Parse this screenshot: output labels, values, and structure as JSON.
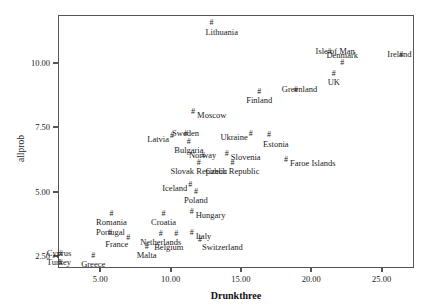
{
  "chart_data": {
    "type": "scatter",
    "title": "",
    "xlabel": "Drunkthree",
    "ylabel": "allprob",
    "xlim": [
      2.0,
      27.3
    ],
    "ylim": [
      2.05,
      11.85
    ],
    "xticks": [
      "5.00",
      "10.00",
      "15.00",
      "20.00",
      "25.00"
    ],
    "xtickvals": [
      5,
      10,
      15,
      20,
      25
    ],
    "yticks": [
      "2.50",
      "5.00",
      "7.50",
      "10.00"
    ],
    "ytickvals": [
      2.5,
      5.0,
      7.5,
      10.0
    ],
    "grid": false,
    "legend": null,
    "marker": "#",
    "points": [
      {
        "label": "Lithuania",
        "x": 12.9,
        "y": 11.55,
        "pos": "below"
      },
      {
        "label": "Isle of Man",
        "x": 21.3,
        "y": 10.4,
        "pos": "mid"
      },
      {
        "label": "Ireland",
        "x": 26.4,
        "y": 10.3,
        "pos": "mid"
      },
      {
        "label": "Denmark",
        "x": 22.2,
        "y": 10.0,
        "pos": "abovec"
      },
      {
        "label": "UK",
        "x": 21.6,
        "y": 9.55,
        "pos": "belowc"
      },
      {
        "label": "Finland",
        "x": 16.3,
        "y": 8.85,
        "pos": "belowc"
      },
      {
        "label": "Greenland",
        "x": 18.9,
        "y": 8.95,
        "pos": "mid"
      },
      {
        "label": "Moscow",
        "x": 11.6,
        "y": 8.1,
        "pos": "right"
      },
      {
        "label": "Sweden",
        "x": 11.1,
        "y": 7.25,
        "pos": "mid"
      },
      {
        "label": "Latvia",
        "x": 10.1,
        "y": 7.15,
        "pos": "left"
      },
      {
        "label": "Ukraine",
        "x": 15.7,
        "y": 7.25,
        "pos": "left"
      },
      {
        "label": "Estonia",
        "x": 17.0,
        "y": 7.2,
        "pos": "below"
      },
      {
        "label": "Bulgaria",
        "x": 11.3,
        "y": 6.95,
        "pos": "belowc"
      },
      {
        "label": "Norway",
        "x": 12.3,
        "y": 6.4,
        "pos": "mid"
      },
      {
        "label": "Slovenia",
        "x": 14.0,
        "y": 6.45,
        "pos": "right"
      },
      {
        "label": "Faroe Islands",
        "x": 18.2,
        "y": 6.25,
        "pos": "right"
      },
      {
        "label": "Slovak Republic",
        "x": 12.0,
        "y": 6.1,
        "pos": "belowc"
      },
      {
        "label": "Czech Republic",
        "x": 14.4,
        "y": 6.1,
        "pos": "belowc"
      },
      {
        "label": "Iceland",
        "x": 11.4,
        "y": 5.25,
        "pos": "left"
      },
      {
        "label": "Poland",
        "x": 11.8,
        "y": 5.0,
        "pos": "belowc"
      },
      {
        "label": "Hungary",
        "x": 11.5,
        "y": 4.2,
        "pos": "right"
      },
      {
        "label": "Croatia",
        "x": 9.5,
        "y": 4.15,
        "pos": "belowc"
      },
      {
        "label": "Romania",
        "x": 5.8,
        "y": 4.15,
        "pos": "belowc"
      },
      {
        "label": "Italy",
        "x": 11.5,
        "y": 3.4,
        "pos": "right"
      },
      {
        "label": "Portugal",
        "x": 5.7,
        "y": 3.4,
        "pos": "mid"
      },
      {
        "label": "Netherlands",
        "x": 9.3,
        "y": 3.35,
        "pos": "belowc"
      },
      {
        "label": "Belgium",
        "x": 10.4,
        "y": 3.35,
        "pos": "below2"
      },
      {
        "label": "Switzerland",
        "x": 12.1,
        "y": 3.15,
        "pos": "rightlow"
      },
      {
        "label": "France",
        "x": 7.0,
        "y": 3.2,
        "pos": "left2"
      },
      {
        "label": "Malta",
        "x": 8.3,
        "y": 2.85,
        "pos": "belowc"
      },
      {
        "label": "Cyprus",
        "x": 2.2,
        "y": 2.6,
        "pos": "mid"
      },
      {
        "label": "Greece",
        "x": 4.5,
        "y": 2.5,
        "pos": "belowc"
      },
      {
        "label": "Turkey",
        "x": 2.2,
        "y": 2.25,
        "pos": "mid"
      }
    ]
  }
}
